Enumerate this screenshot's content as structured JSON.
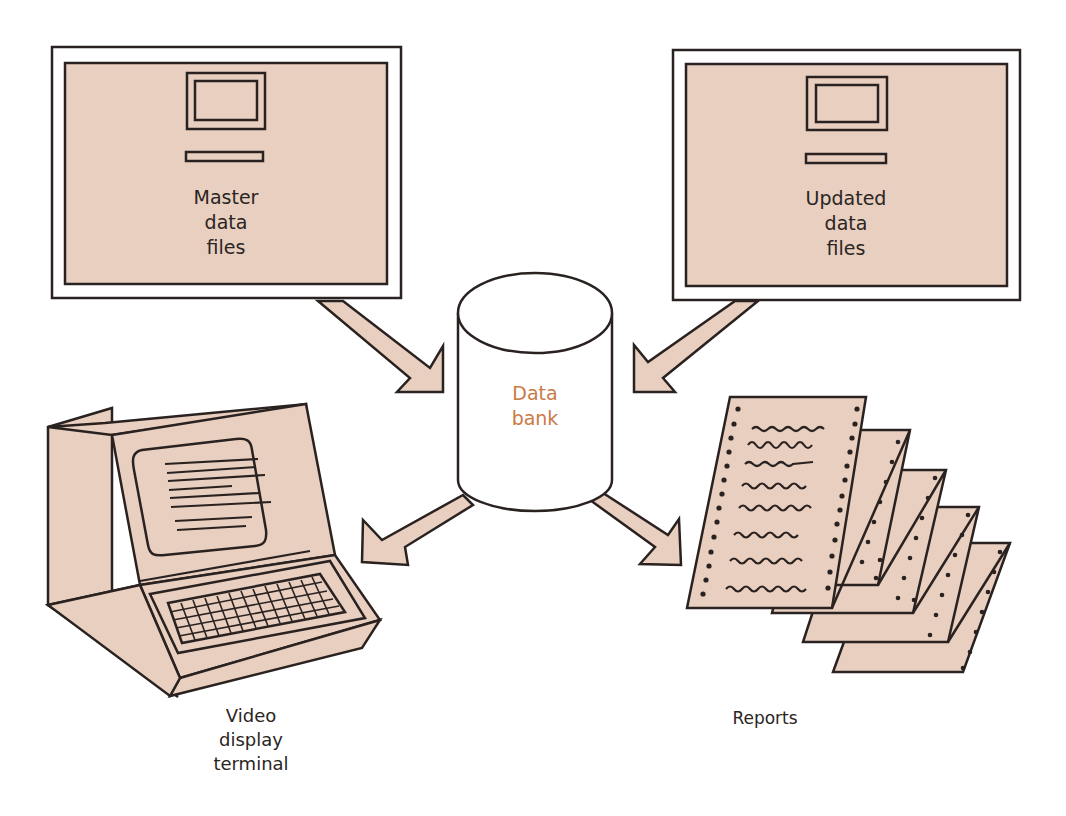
{
  "diagram": {
    "colors": {
      "fill": "#e8cfc0",
      "stroke": "#2a2220",
      "accent_text": "#c97a45",
      "background": "#ffffff"
    },
    "nodes": {
      "master": {
        "icon": "computer-file-icon",
        "lines": [
          "Master",
          "data",
          "files"
        ]
      },
      "updated": {
        "icon": "computer-file-icon",
        "lines": [
          "Updated",
          "data",
          "files"
        ]
      },
      "databank": {
        "icon": "database-cylinder-icon",
        "lines": [
          "Data",
          "bank"
        ]
      },
      "terminal": {
        "icon": "video-terminal-icon",
        "lines": [
          "Video",
          "display",
          "terminal"
        ]
      },
      "reports": {
        "icon": "printout-stack-icon",
        "lines": [
          "Reports"
        ]
      }
    },
    "edges": [
      {
        "from": "Master data files",
        "to": "Data bank"
      },
      {
        "from": "Updated data files",
        "to": "Data bank"
      },
      {
        "from": "Data bank",
        "to": "Video display terminal"
      },
      {
        "from": "Data bank",
        "to": "Reports"
      }
    ]
  }
}
